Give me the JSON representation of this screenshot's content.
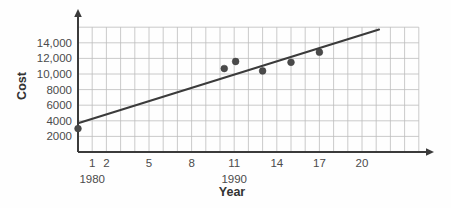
{
  "chart_data": {
    "type": "scatter",
    "title": "",
    "xlabel": "Year",
    "ylabel": "Cost",
    "xlim": [
      -1,
      24
    ],
    "ylim": [
      0,
      16000
    ],
    "grid": true,
    "legend": "none",
    "x_tick_labels": [
      "1",
      "2",
      "5",
      "8",
      "11",
      "14",
      "17",
      "20"
    ],
    "x_tick_values": [
      1,
      2,
      5,
      8,
      11,
      14,
      17,
      20
    ],
    "y_tick_labels": [
      "2000",
      "4000",
      "6000",
      "8000",
      "10,000",
      "12,000",
      "14,000"
    ],
    "y_tick_values": [
      2000,
      4000,
      6000,
      8000,
      10000,
      12000,
      14000
    ],
    "decade_labels": [
      {
        "text": "1980",
        "at_x": 1
      },
      {
        "text": "1990",
        "at_x": 11
      }
    ],
    "points": [
      {
        "x": 0,
        "y": 3000
      },
      {
        "x": 10.3,
        "y": 10700
      },
      {
        "x": 11.1,
        "y": 11600
      },
      {
        "x": 13.0,
        "y": 10400
      },
      {
        "x": 15.0,
        "y": 11500
      },
      {
        "x": 17.0,
        "y": 12800
      }
    ],
    "trend_line": {
      "name": "line of best fit",
      "x_start": 0,
      "y_start": 3700,
      "x_end": 21.2,
      "y_end": 15700
    },
    "colors": {
      "point": "#4a4a4a",
      "line": "#3b3b3b",
      "grid": "#bdbdbd",
      "axis": "#3b3b3b",
      "text": "#4b4b4b",
      "background": "#fefefe"
    }
  },
  "axis_titles": {
    "y": "Cost",
    "x": "Year"
  }
}
